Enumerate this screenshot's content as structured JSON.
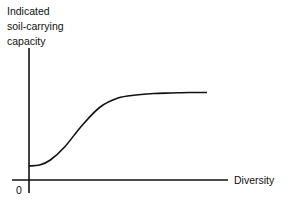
{
  "chart_data": {
    "type": "line",
    "title": "",
    "xlabel": "Diversity",
    "ylabel": "Indicated soil-carrying capacity",
    "ylabel_lines": [
      "Indicated",
      "soil-carrying",
      "capacity"
    ],
    "origin_label": "0",
    "x_ticks": [],
    "y_ticks": [],
    "grid": false,
    "legend": null,
    "series": [
      {
        "name": "Indicated soil-carrying capacity",
        "x": [
          0,
          0.06,
          0.12,
          0.2,
          0.3,
          0.4,
          0.5,
          0.6,
          0.7,
          0.8,
          0.9,
          1.0
        ],
        "values": [
          0.14,
          0.15,
          0.2,
          0.33,
          0.55,
          0.73,
          0.82,
          0.85,
          0.865,
          0.87,
          0.875,
          0.875
        ]
      }
    ]
  },
  "labels": {
    "ylabel": "Indicated\nsoil-carrying\ncapacity",
    "xlabel": "Diversity",
    "origin": "0"
  },
  "colors": {
    "line": "#111111",
    "background": "#ffffff"
  }
}
